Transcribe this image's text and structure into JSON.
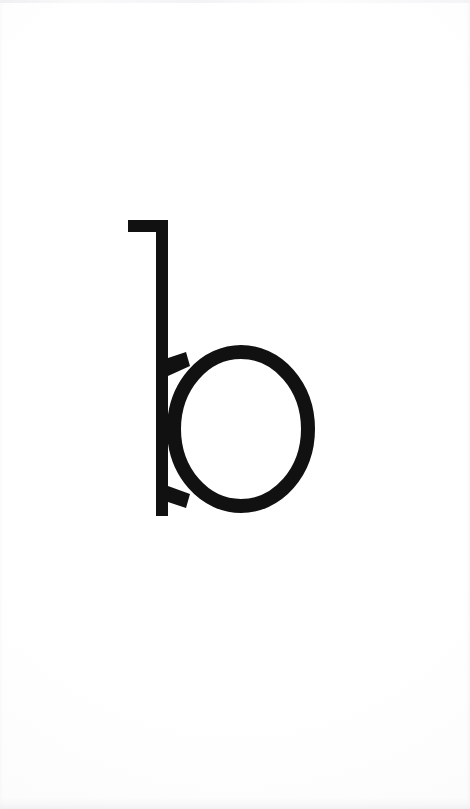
{
  "page": {
    "width": 470,
    "height": 809,
    "background_color": "#fdfdfd",
    "paper_tone": "#fafafa",
    "kind": "printed-letter-specimen"
  },
  "glyph": {
    "character": "b",
    "name": "lowercase-letter-b",
    "ink_color": "#111111",
    "style": "geometric sans-serif with short top flag",
    "geometry": {
      "flag": {
        "x": 128,
        "y": 220,
        "width": 40,
        "height": 12
      },
      "stem": {
        "x": 156,
        "y": 220,
        "width": 12,
        "height": 296
      },
      "bowl": {
        "center_x": 241,
        "center_y": 429,
        "radius_x": 74,
        "radius_y": 84,
        "stroke_width": 14
      },
      "bounds": {
        "left": 128,
        "top": 220,
        "right": 315,
        "bottom": 516
      }
    }
  },
  "caption": {
    "text": "b"
  }
}
